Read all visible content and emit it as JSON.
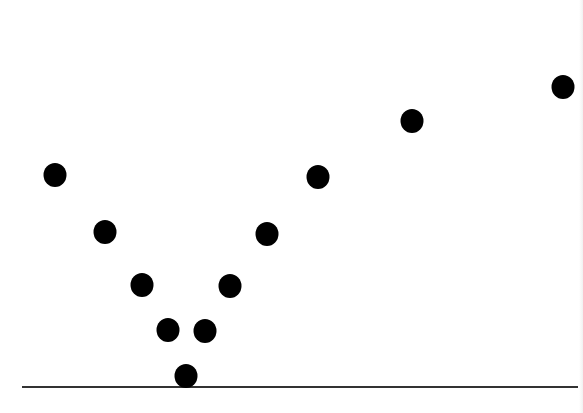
{
  "chart_data": {
    "type": "scatter",
    "title": "",
    "xlabel": "",
    "ylabel": "",
    "grid": false,
    "legend": null,
    "marker": {
      "shape": "circle",
      "color": "#000000",
      "radius_px": 12
    },
    "baseline": {
      "color": "#333333",
      "x_start_px": 22,
      "x_end_px": 578,
      "y_px": 387
    },
    "points_px": [
      {
        "x": 55,
        "y": 175
      },
      {
        "x": 105,
        "y": 232
      },
      {
        "x": 142,
        "y": 285
      },
      {
        "x": 168,
        "y": 330
      },
      {
        "x": 186,
        "y": 376
      },
      {
        "x": 205,
        "y": 331
      },
      {
        "x": 230,
        "y": 286
      },
      {
        "x": 267,
        "y": 234
      },
      {
        "x": 318,
        "y": 177
      },
      {
        "x": 412,
        "y": 121
      },
      {
        "x": 563,
        "y": 87
      }
    ],
    "x": [
      1,
      2,
      3,
      4,
      5,
      6,
      7,
      8,
      9,
      10,
      11
    ],
    "y": [
      212,
      155,
      102,
      57,
      11,
      56,
      101,
      153,
      210,
      266,
      300
    ],
    "note": "Values estimated as height above baseline in pixels; no axes ticks or labels are shown."
  }
}
